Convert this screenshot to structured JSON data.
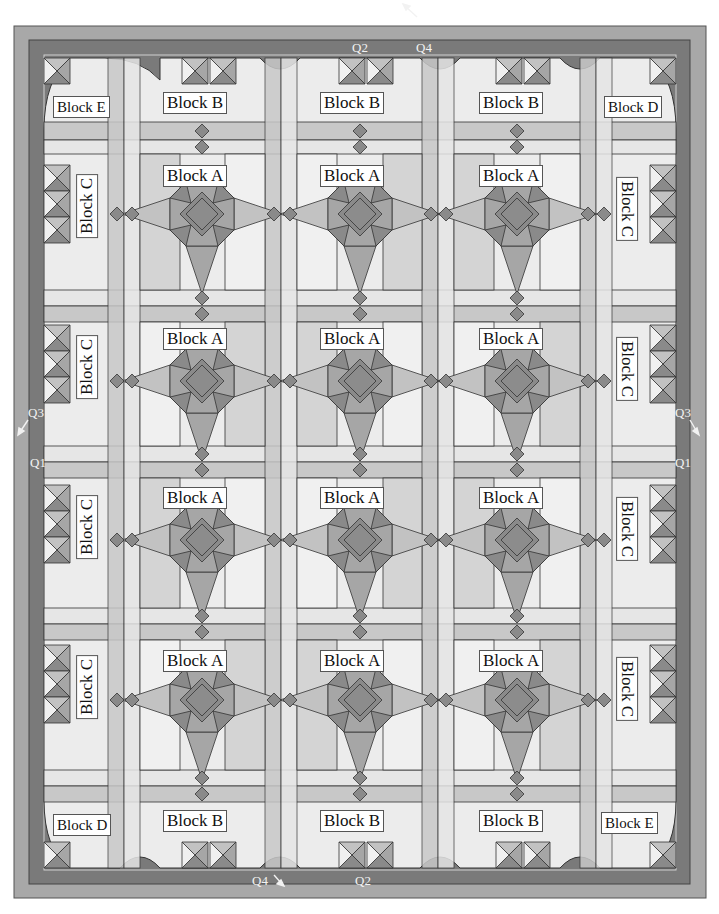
{
  "diagram": {
    "type": "quilt-layout",
    "colors": {
      "outer_border": "#a8a8a8",
      "inner_border": "#7a7a7a",
      "background_light": "#f2f2f2",
      "strip_light": "#e6e6e6",
      "strip_mid": "#c8c8c8",
      "star_dark": "#8a8a8a",
      "star_mid": "#a6a6a6",
      "star_light": "#c2c2c2",
      "line": "#333333"
    },
    "grid": {
      "columns": 3,
      "rows": 4
    },
    "labels": {
      "top": [
        "Block E",
        "Block B",
        "Block B",
        "Block B",
        "Block D"
      ],
      "bottom": [
        "Block D",
        "Block B",
        "Block B",
        "Block B",
        "Block E"
      ],
      "block_a": "Block A",
      "block_c": "Block C"
    },
    "quadrant_markers": {
      "top_q2": "Q2",
      "top_q4": "Q4",
      "left_q3": "Q3",
      "left_q1": "Q1",
      "right_q3": "Q3",
      "right_q1": "Q1",
      "bottom_q4": "Q4",
      "bottom_q2": "Q2"
    }
  }
}
